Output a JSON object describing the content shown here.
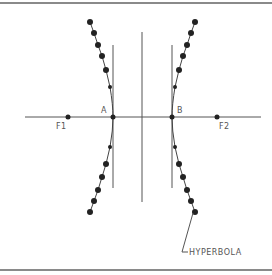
{
  "diagram": {
    "title": "Hyperbola",
    "labels": {
      "vertex_left": "A",
      "vertex_right": "B",
      "focus_left": "F1",
      "focus_right": "F2",
      "curve_name": "HYPERBOLA"
    },
    "colors": {
      "frame": "#8a8a8a",
      "line": "#555555",
      "dot": "#222222",
      "text": "#555555"
    }
  }
}
